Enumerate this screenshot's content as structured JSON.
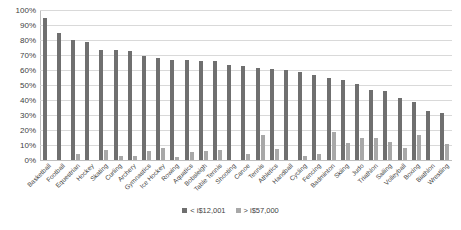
{
  "chart_data": {
    "type": "bar",
    "title": "",
    "subtitle": "",
    "xlabel": "",
    "ylabel": "",
    "ylim": [
      0,
      100
    ],
    "ytick_labels": [
      "100%",
      "90%",
      "80%",
      "70%",
      "60%",
      "50%",
      "40%",
      "30%",
      "20%",
      "10%",
      "0%"
    ],
    "ytick_values": [
      100,
      90,
      80,
      70,
      60,
      50,
      40,
      30,
      20,
      10,
      0
    ],
    "grid": true,
    "legend_position": "bottom",
    "categories": [
      "Basketball",
      "Football",
      "Equestrian",
      "Hockey",
      "Skating",
      "Curling",
      "Archery",
      "Gymnastics",
      "Ice Hockey",
      "Rowing",
      "Aquatics",
      "Bobsleigh",
      "Table Tennis",
      "Shooting",
      "Canoe",
      "Tennis",
      "Athletics",
      "Handball",
      "Cycling",
      "Fencing",
      "Badminton",
      "Skiing",
      "Judo",
      "Triathlon",
      "Sailing",
      "Volleyball",
      "Boxing",
      "Biathlon",
      "Wrestling"
    ],
    "series": [
      {
        "name": "< i$12,001",
        "color": "#6f6f6f",
        "values": [
          94.5,
          84.5,
          80.0,
          78.5,
          73.5,
          73.5,
          72.5,
          69.5,
          68.0,
          67.0,
          66.5,
          66.0,
          66.0,
          63.5,
          62.5,
          61.5,
          60.5,
          60.0,
          59.0,
          56.5,
          55.0,
          53.5,
          51.0,
          47.0,
          46.0,
          41.5,
          38.5,
          33.0,
          31.5
        ]
      },
      {
        "name": "> i$57,000",
        "color": "#a8a8a8",
        "values": [
          0.0,
          0.0,
          4.0,
          0.0,
          6.5,
          2.5,
          3.0,
          6.0,
          8.0,
          2.0,
          5.5,
          6.0,
          7.0,
          0.0,
          4.0,
          16.5,
          7.5,
          0.0,
          2.5,
          4.0,
          19.0,
          11.5,
          15.0,
          15.0,
          12.0,
          8.0,
          16.5,
          0.0,
          11.0
        ]
      }
    ]
  }
}
